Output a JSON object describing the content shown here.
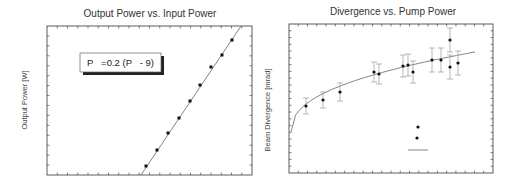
{
  "chart_data": [
    {
      "type": "scatter",
      "title": "Output Power vs. Input Power",
      "xlabel": "",
      "ylabel": "Output Power [W]",
      "grid": false,
      "annotation": "P   =0.2 (P   - 9)",
      "plot_box": {
        "x0": 47,
        "y0": 26,
        "x1": 252,
        "y1": 175
      },
      "ticks": {
        "x_count": 20,
        "y_count": 15
      },
      "fit_line": {
        "x1": 141,
        "y1": 175,
        "x2": 241,
        "y2": 26
      },
      "points_px": [
        [
          146,
          166
        ],
        [
          157,
          150
        ],
        [
          168,
          133
        ],
        [
          179,
          118
        ],
        [
          190,
          101
        ],
        [
          200,
          85
        ],
        [
          211,
          67
        ],
        [
          222,
          55
        ],
        [
          232,
          40
        ]
      ],
      "series": [
        {
          "name": "measured",
          "marker": "square"
        },
        {
          "name": "linear fit",
          "slope": 0.2,
          "x_intercept": 9
        }
      ]
    },
    {
      "type": "scatter",
      "title": "Divergence vs. Pump Power",
      "xlabel": "",
      "ylabel": "Beam Divergence [mrad]",
      "grid": false,
      "plot_box": {
        "x0": 289,
        "y0": 24,
        "x1": 493,
        "y1": 173
      },
      "ticks": {
        "x_count": 22,
        "y_count": 22
      },
      "points_px": [
        [
          306,
          106,
          8
        ],
        [
          323,
          100,
          8
        ],
        [
          340,
          92,
          9
        ],
        [
          374,
          72,
          10
        ],
        [
          379,
          74,
          10
        ],
        [
          403,
          66,
          11
        ],
        [
          408,
          65,
          11
        ],
        [
          413,
          72,
          11
        ],
        [
          432,
          60,
          12
        ],
        [
          441,
          60,
          12
        ],
        [
          450,
          40,
          12
        ],
        [
          450,
          67,
          12
        ],
        [
          458,
          63,
          12
        ]
      ],
      "fit_curve": {
        "x_start": 291,
        "y_start": 132,
        "x_end": 475,
        "y_end": 52
      },
      "legend_marks": {
        "dots": [
          [
            418,
            127
          ],
          [
            417,
            138
          ]
        ],
        "line": {
          "x1": 408,
          "x2": 428,
          "y": 150
        }
      },
      "series": [
        {
          "name": "measured divergence",
          "marker": "circle",
          "error_bars": true
        },
        {
          "name": "fit",
          "shape": "sqrt-like curve"
        }
      ]
    }
  ],
  "colors": {
    "axis": "#333333",
    "marker": "#111111",
    "line": "#777777",
    "error_bar": "#999999",
    "box_shadow": "#222222"
  }
}
